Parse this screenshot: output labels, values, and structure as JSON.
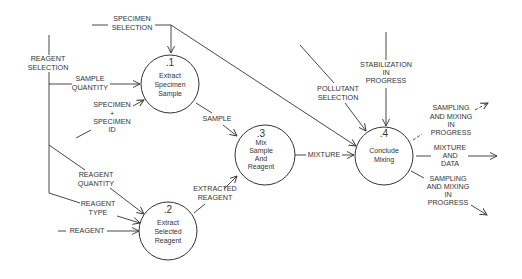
{
  "diagram": {
    "type": "data-flow-diagram",
    "processes": [
      {
        "id": ".1",
        "line1": "Extract",
        "line2": "Specimen",
        "line3": "Sample"
      },
      {
        "id": ".2",
        "line1": "Extract",
        "line2": "Selected",
        "line3": "Reagent"
      },
      {
        "id": ".3",
        "line1": "Mix",
        "line2": "Sample",
        "line3": "And",
        "line4": "Reagent"
      },
      {
        "id": ".4",
        "line1": "Conclude",
        "line2": "Mixing"
      }
    ],
    "flows": {
      "specimen_selection": [
        "SPECIMEN",
        "SELECTION"
      ],
      "reagent_selection": [
        "REAGENT",
        "SELECTION"
      ],
      "sample_quantity": [
        "SAMPLE",
        "QUANTITY"
      ],
      "specimen_plus_id": [
        "SPECIMEN",
        "+",
        "SPECIMEN",
        "ID"
      ],
      "reagent_quantity": [
        "REAGENT",
        "QUANTITY"
      ],
      "reagent_type": [
        "REAGENT",
        "TYPE"
      ],
      "reagent": "REAGENT",
      "sample": "SAMPLE",
      "extracted_reagent": [
        "EXTRACTED",
        "REAGENT"
      ],
      "mixture": "MIXTURE",
      "pollutant_selection": [
        "POLLUTANT",
        "SELECTION"
      ],
      "stabilization": [
        "STABILIZATION",
        "IN",
        "PROGRESS"
      ],
      "sampling_top": [
        "SAMPLING",
        "AND MIXING",
        "IN",
        "PROGRESS"
      ],
      "mixture_data": [
        "MIXTURE",
        "AND",
        "DATA"
      ],
      "sampling_bottom": [
        "SAMPLING",
        "AND MIXING",
        "IN",
        "PROGRESS"
      ]
    }
  }
}
